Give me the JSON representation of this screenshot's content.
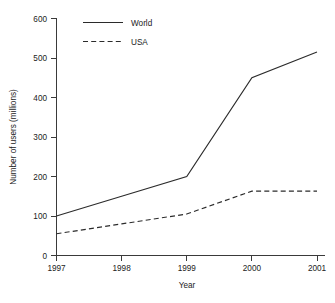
{
  "chart_data": {
    "type": "line",
    "title": "",
    "xlabel": "Year",
    "ylabel": "Number of users (millions)",
    "x": [
      1997,
      1998,
      1999,
      2000,
      2001
    ],
    "xtick_labels": [
      "1997",
      "1998",
      "1999",
      "2000",
      "2001"
    ],
    "ytick_labels": [
      "0",
      "100",
      "200",
      "300",
      "400",
      "500",
      "600"
    ],
    "ytick_values": [
      0,
      100,
      200,
      300,
      400,
      500,
      600
    ],
    "xlim": [
      1997,
      2001
    ],
    "ylim": [
      0,
      600
    ],
    "grid": false,
    "legend_position": "top-left-inside",
    "series": [
      {
        "name": "World",
        "style": "solid",
        "color": "#2b2b2b",
        "values": [
          100,
          150,
          200,
          450,
          515
        ]
      },
      {
        "name": "USA",
        "style": "dashed",
        "color": "#2b2b2b",
        "values": [
          55,
          80,
          105,
          163,
          163
        ]
      }
    ]
  },
  "axes": {
    "y_title": "Number of users (millions)",
    "x_title": "Year",
    "y_ticks": [
      "600",
      "500",
      "400",
      "300",
      "200",
      "100",
      "0"
    ],
    "x_ticks": [
      "1997",
      "1998",
      "1999",
      "2000",
      "2001"
    ]
  },
  "legend": {
    "entries": [
      {
        "label": "World",
        "style": "solid"
      },
      {
        "label": "USA",
        "style": "dashed"
      }
    ]
  }
}
